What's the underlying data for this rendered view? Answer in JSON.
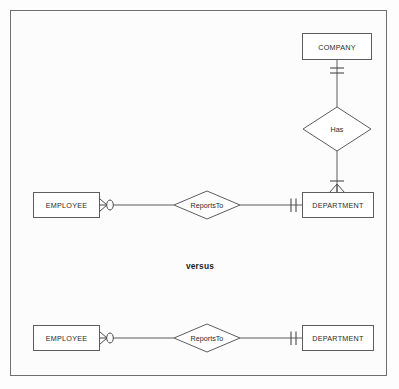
{
  "diagram": {
    "title_text": "versus",
    "frame": {
      "border_color": "#6f6f70",
      "background": "#fcfcfc"
    },
    "colors": {
      "shape_stroke": "#5d5d5f",
      "shape_fill": "#ffffff",
      "connector": "#5d5d5f",
      "notation": "#4a4a4c",
      "text": "#2a2a2a"
    },
    "top_model": {
      "name": "ternary-decomposed-model",
      "entities": [
        {
          "id": "company",
          "label": "COMPANY"
        },
        {
          "id": "department",
          "label": "DEPARTMENT"
        },
        {
          "id": "employee",
          "label": "EMPLOYEE"
        }
      ],
      "relationships": [
        {
          "id": "has",
          "label": "Has"
        },
        {
          "id": "reports-to",
          "label": "ReportsTo"
        }
      ],
      "connections": [
        {
          "from": "company",
          "to": "has",
          "cardinality_at_from": "one-and-only-one",
          "cardinality_at_to": "one"
        },
        {
          "from": "has",
          "to": "department",
          "cardinality_at_from": "one",
          "cardinality_at_to": "one-or-many"
        },
        {
          "from": "employee",
          "to": "reports-to",
          "cardinality_at_from": "zero-or-many",
          "cardinality_at_to": "one"
        },
        {
          "from": "reports-to",
          "to": "department",
          "cardinality_at_from": "one",
          "cardinality_at_to": "one-and-only-one"
        }
      ]
    },
    "bottom_model": {
      "name": "binary-only-model",
      "entities": [
        {
          "id": "employee2",
          "label": "EMPLOYEE"
        },
        {
          "id": "department2",
          "label": "DEPARTMENT"
        }
      ],
      "relationships": [
        {
          "id": "reports-to-2",
          "label": "ReportsTo"
        }
      ],
      "connections": [
        {
          "from": "employee2",
          "to": "reports-to-2",
          "cardinality_at_from": "zero-or-many",
          "cardinality_at_to": "one"
        },
        {
          "from": "reports-to-2",
          "to": "department2",
          "cardinality_at_from": "one",
          "cardinality_at_to": "one-and-only-one"
        }
      ]
    }
  }
}
